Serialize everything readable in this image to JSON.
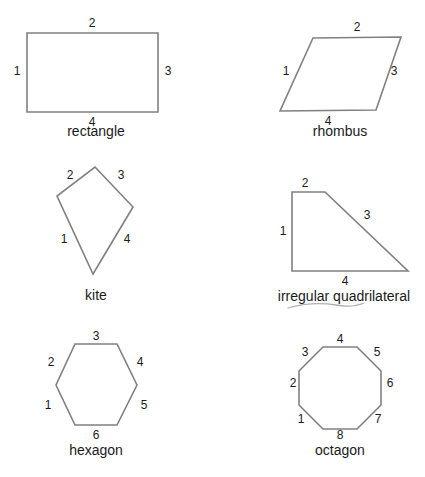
{
  "page": {
    "background_color": "#ffffff",
    "stroke_color": "#808080",
    "text_color": "#1a1a1a",
    "width": 425,
    "height": 477
  },
  "figures": [
    {
      "id": "rectangle",
      "caption": "rectangle",
      "caption_x": 96,
      "caption_y": 124,
      "sides": 4,
      "points": "27,33 158,33 158,112 27,112",
      "labels": [
        {
          "text": "1",
          "x": 17,
          "y": 71
        },
        {
          "text": "2",
          "x": 92,
          "y": 23
        },
        {
          "text": "3",
          "x": 168,
          "y": 71
        },
        {
          "text": "4",
          "x": 92,
          "y": 122
        }
      ]
    },
    {
      "id": "rhombus",
      "caption": "rhombus",
      "caption_x": 340,
      "caption_y": 124,
      "sides": 4,
      "points": "313,38 401,37 376,110 280,111",
      "labels": [
        {
          "text": "1",
          "x": 286,
          "y": 71
        },
        {
          "text": "2",
          "x": 357,
          "y": 27
        },
        {
          "text": "3",
          "x": 394,
          "y": 71
        },
        {
          "text": "4",
          "x": 328,
          "y": 121
        }
      ]
    },
    {
      "id": "kite",
      "caption": "kite",
      "caption_x": 96,
      "caption_y": 288,
      "sides": 4,
      "points": "95,167 133,207 93,274 57,196",
      "labels": [
        {
          "text": "1",
          "x": 64,
          "y": 239
        },
        {
          "text": "2",
          "x": 70,
          "y": 175
        },
        {
          "text": "3",
          "x": 121,
          "y": 175
        },
        {
          "text": "4",
          "x": 127,
          "y": 239
        }
      ]
    },
    {
      "id": "irregular-quadrilateral",
      "caption": "irregular quadrilateral",
      "caption_x": 344,
      "caption_y": 289,
      "sides": 4,
      "points": "292,192 325,192 408,271 292,271",
      "labels": [
        {
          "text": "1",
          "x": 283,
          "y": 231
        },
        {
          "text": "2",
          "x": 305,
          "y": 183
        },
        {
          "text": "3",
          "x": 367,
          "y": 215
        },
        {
          "text": "4",
          "x": 345,
          "y": 281
        }
      ],
      "has_squiggle_underline": true,
      "squiggle_path": "M 288 308 Q 312 301 336 305 Q 352 308 364 303"
    },
    {
      "id": "hexagon",
      "caption": "hexagon",
      "caption_x": 96,
      "caption_y": 443,
      "sides": 6,
      "points": "75,344 117,344 137,385 117,425 75,425 56,385",
      "labels": [
        {
          "text": "1",
          "x": 48,
          "y": 405
        },
        {
          "text": "2",
          "x": 51,
          "y": 362
        },
        {
          "text": "3",
          "x": 96,
          "y": 336
        },
        {
          "text": "4",
          "x": 140,
          "y": 362
        },
        {
          "text": "5",
          "x": 144,
          "y": 405
        },
        {
          "text": "6",
          "x": 96,
          "y": 435
        }
      ]
    },
    {
      "id": "octagon",
      "caption": "octagon",
      "caption_x": 340,
      "caption_y": 443,
      "sides": 8,
      "points": "323,347 357,347 381,371 381,405 357,429 323,429 299,405 299,371",
      "labels": [
        {
          "text": "1",
          "x": 301,
          "y": 419
        },
        {
          "text": "2",
          "x": 293,
          "y": 383
        },
        {
          "text": "3",
          "x": 305,
          "y": 352
        },
        {
          "text": "4",
          "x": 340,
          "y": 339
        },
        {
          "text": "5",
          "x": 377,
          "y": 352
        },
        {
          "text": "6",
          "x": 390,
          "y": 383
        },
        {
          "text": "7",
          "x": 378,
          "y": 419
        },
        {
          "text": "8",
          "x": 340,
          "y": 435
        }
      ]
    }
  ]
}
